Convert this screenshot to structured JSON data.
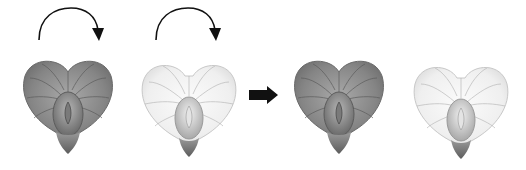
{
  "figure": {
    "panels": [
      {
        "id": "flower-1",
        "shade": "dark",
        "x": 22,
        "y": 56,
        "w": 92,
        "h": 100
      },
      {
        "id": "flower-2",
        "shade": "light",
        "x": 141,
        "y": 58,
        "w": 96,
        "h": 100
      },
      {
        "id": "flower-3",
        "shade": "dark",
        "x": 293,
        "y": 56,
        "w": 92,
        "h": 100
      },
      {
        "id": "flower-4",
        "shade": "light",
        "x": 413,
        "y": 60,
        "w": 96,
        "h": 100
      }
    ],
    "arrows": [
      {
        "id": "curved-arrow-1",
        "type": "clockwise-rotation",
        "x": 36,
        "y": 6
      },
      {
        "id": "curved-arrow-2",
        "type": "clockwise-rotation",
        "x": 153,
        "y": 6
      },
      {
        "id": "right-arrow",
        "type": "block-right",
        "x": 249,
        "y": 86
      }
    ],
    "colors": {
      "dark_fill": "#8a8a8a",
      "dark_vein": "#5a5a5a",
      "light_fill": "#f2f2f2",
      "light_vein": "#b4b4b4",
      "arrow": "#111111",
      "background": "#ffffff"
    }
  }
}
